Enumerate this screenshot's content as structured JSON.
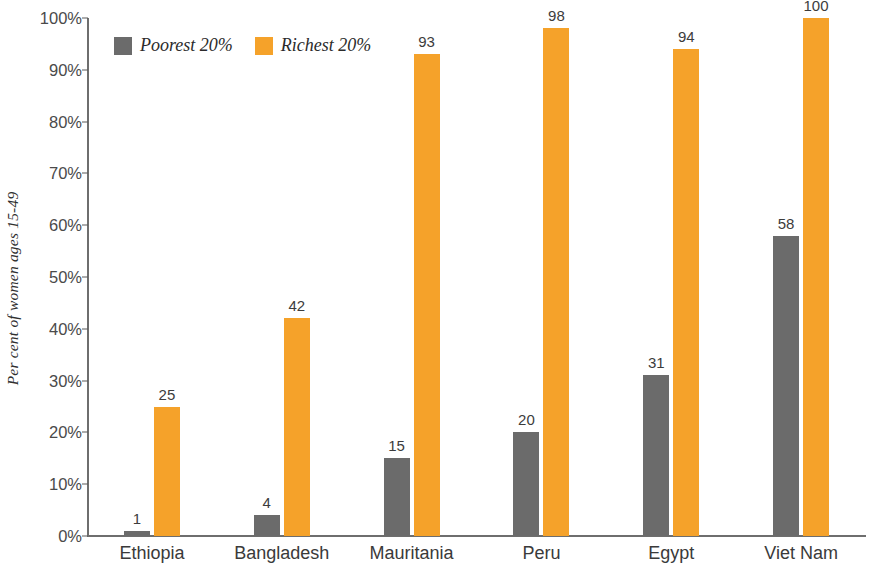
{
  "chart_data": {
    "type": "bar",
    "title": "",
    "subtitle": "",
    "xlabel": "",
    "ylabel": "Per cent of women ages 15-49",
    "ylim": [
      0,
      100
    ],
    "grid": false,
    "legend_position": "top-left",
    "categories": [
      "Ethiopia",
      "Bangladesh",
      "Mauritania",
      "Peru",
      "Egypt",
      "Viet Nam"
    ],
    "y_ticks": [
      "0%",
      "10%",
      "20%",
      "30%",
      "40%",
      "50%",
      "60%",
      "70%",
      "80%",
      "90%",
      "100%"
    ],
    "y_tick_values": [
      0,
      10,
      20,
      30,
      40,
      50,
      60,
      70,
      80,
      90,
      100
    ],
    "series": [
      {
        "name": "Poorest 20%",
        "color": "#6B6B6B",
        "values": [
          1,
          4,
          15,
          20,
          31,
          58
        ],
        "labels": [
          "1",
          "4",
          "15",
          "20",
          "31",
          "58"
        ]
      },
      {
        "name": "Richest 20%",
        "color": "#F5A22A",
        "values": [
          25,
          42,
          93,
          98,
          94,
          100
        ],
        "labels": [
          "25",
          "42",
          "93",
          "98",
          "94",
          "100"
        ]
      }
    ]
  },
  "legend": {
    "items": [
      {
        "label": "Poorest 20%",
        "color": "#6B6B6B"
      },
      {
        "label": "Richest 20%",
        "color": "#F5A22A"
      }
    ]
  },
  "axis": {
    "y_title": "Per cent of women ages 15-49"
  },
  "colors": {
    "poorest": "#6B6B6B",
    "richest": "#F5A22A",
    "axis": "#6E6E6E",
    "text": "#3A3A3A",
    "background": "#FFFFFF"
  }
}
